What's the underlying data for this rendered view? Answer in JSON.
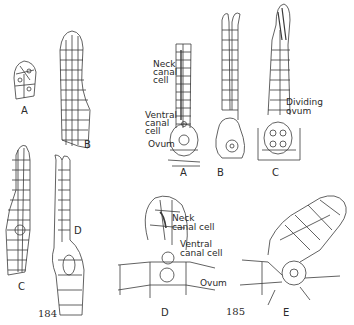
{
  "figure_184": {
    "number": "184",
    "panels": {
      "A": "A",
      "B": "B",
      "C": "C",
      "D": "D"
    }
  },
  "figure_185": {
    "number": "185",
    "top_row": {
      "panels": {
        "A": "A",
        "B": "B",
        "C": "C"
      },
      "labels": {
        "neck_canal_cell": [
          "Neck",
          "canal",
          "cell"
        ],
        "ventral_canal_cell": [
          "Ventral",
          "canal",
          "cell"
        ],
        "ovum": "Ovum",
        "dividing_ovum": [
          "Dividing",
          "ovum"
        ]
      }
    },
    "bottom_row": {
      "panels": {
        "D": "D",
        "E": "E"
      },
      "labels": {
        "neck_canal_cell": [
          "Neck",
          "canal cell"
        ],
        "ventral_canal_cell": [
          "Ventral",
          "canal cell"
        ],
        "ovum": "Ovum"
      }
    }
  },
  "colors": {
    "ink": "#2a2a2a",
    "background": "#ffffff"
  }
}
